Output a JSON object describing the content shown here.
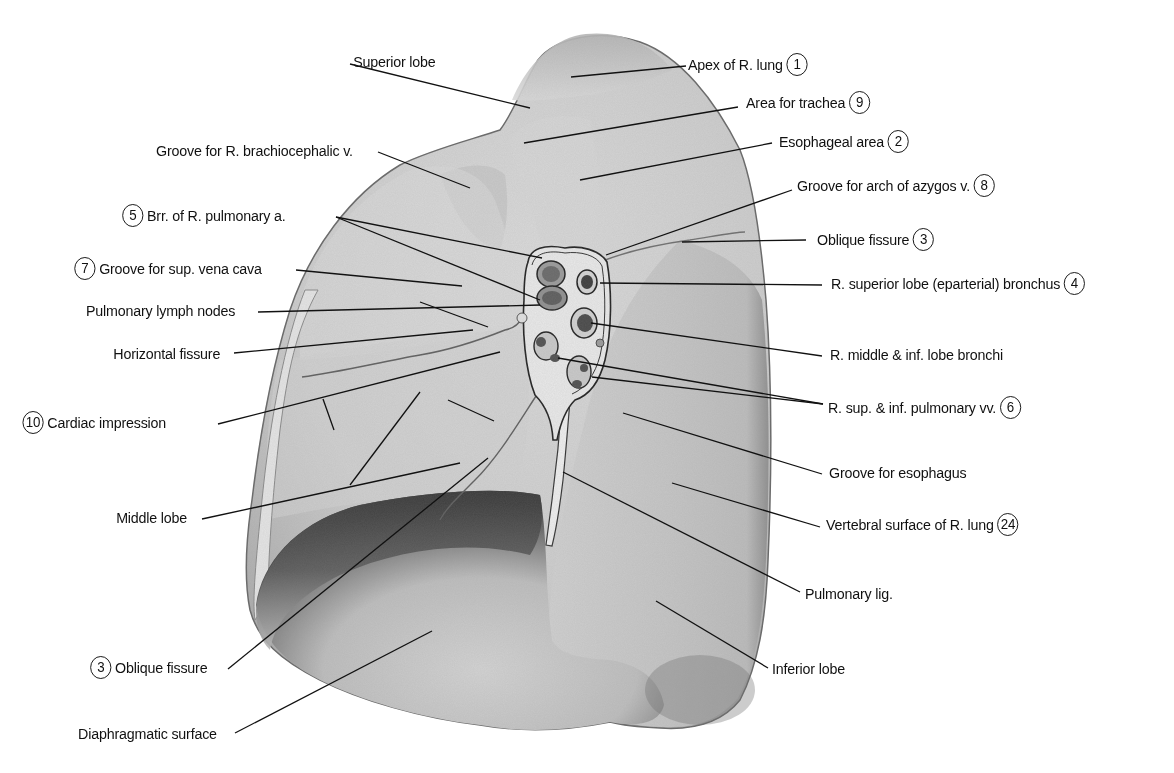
{
  "figure": {
    "colors": {
      "background": "#ffffff",
      "lung_base": "#c9c9c9",
      "lung_light": "#dcdcdc",
      "shadow": "#5a5a5a",
      "leader": "#111111"
    }
  },
  "labels": {
    "left": [
      {
        "id": "superior-lobe",
        "text": "Superior lobe",
        "num": null,
        "x": 346,
        "y": 52,
        "ax": 530,
        "ay": 108,
        "lx": 350,
        "ly": 64
      },
      {
        "id": "groove-brachiocephalic",
        "text": "Groove for R. brachiocephalic v.",
        "num": null,
        "x": 139,
        "y": 141,
        "ax": 470,
        "ay": 188,
        "lx": 378,
        "ly": 152
      },
      {
        "id": "brr-pulmonary-a",
        "text": "Brr. of R. pulmonary a.",
        "num": "5",
        "x": 108,
        "y": 206,
        "ax": 542,
        "ay": 258,
        "ax2": 540,
        "ay2": 300,
        "lx": 336,
        "ly": 217
      },
      {
        "id": "groove-svc",
        "text": "Groove for sup. vena cava",
        "num": "7",
        "x": 58,
        "y": 259,
        "ax": 462,
        "ay": 286,
        "lx": 296,
        "ly": 270
      },
      {
        "id": "pulmonary-lymph-nodes",
        "text": "Pulmonary lymph nodes",
        "num": null,
        "x": 73,
        "y": 301,
        "ax": 540,
        "ay": 305,
        "lx": 258,
        "ly": 312
      },
      {
        "id": "horizontal-fissure",
        "text": "Horizontal fissure",
        "num": null,
        "x": 104,
        "y": 344,
        "ax": 473,
        "ay": 330,
        "lx": 234,
        "ly": 353
      },
      {
        "id": "cardiac-impression",
        "text": "Cardiac impression",
        "num": "10",
        "x": 10,
        "y": 413,
        "ax": 500,
        "ay": 352,
        "lx": 218,
        "ly": 424
      },
      {
        "id": "middle-lobe",
        "text": "Middle lobe",
        "num": null,
        "x": 110,
        "y": 508,
        "ax": 460,
        "ay": 463,
        "lx": 202,
        "ly": 519
      },
      {
        "id": "oblique-fissure-left",
        "text": "Oblique fissure",
        "num": "3",
        "x": 80,
        "y": 658,
        "ax": 488,
        "ay": 458,
        "lx": 228,
        "ly": 669
      },
      {
        "id": "diaphragmatic-surface",
        "text": "Diaphragmatic surface",
        "num": null,
        "x": 66,
        "y": 724,
        "ax": 432,
        "ay": 631,
        "lx": 235,
        "ly": 733
      }
    ],
    "right": [
      {
        "id": "apex",
        "text": "Apex of R. lung",
        "num": "1",
        "numPos": "after",
        "x": 688,
        "y": 55,
        "ax": 571,
        "ay": 77,
        "lx": 686,
        "ly": 66
      },
      {
        "id": "area-trachea",
        "text": "Area for trachea",
        "num": "9",
        "numPos": "after",
        "x": 746,
        "y": 93,
        "ax": 524,
        "ay": 143,
        "lx": 738,
        "ly": 107
      },
      {
        "id": "esophageal-area",
        "text": "Esophageal area",
        "num": "2",
        "numPos": "after",
        "x": 779,
        "y": 132,
        "ax": 580,
        "ay": 180,
        "lx": 772,
        "ly": 143
      },
      {
        "id": "groove-azygos",
        "text": "Groove for arch of azygos v.",
        "num": "8",
        "numPos": "after",
        "x": 797,
        "y": 176,
        "ax": 606,
        "ay": 255,
        "lx": 792,
        "ly": 190
      },
      {
        "id": "oblique-fissure-right",
        "text": "Oblique fissure",
        "num": "3",
        "numPos": "after",
        "x": 817,
        "y": 230,
        "ax": 682,
        "ay": 242,
        "lx": 806,
        "ly": 240
      },
      {
        "id": "r-superior-bronchus",
        "text": "R. superior lobe (eparterial) bronchus",
        "num": "4",
        "numPos": "after",
        "x": 831,
        "y": 274,
        "ax": 600,
        "ay": 283,
        "lx": 822,
        "ly": 285
      },
      {
        "id": "r-middle-inf-bronchi",
        "text": "R. middle & inf. lobe bronchi",
        "num": null,
        "x": 830,
        "y": 345,
        "ax": 591,
        "ay": 323,
        "lx": 822,
        "ly": 356
      },
      {
        "id": "r-pulmonary-vv",
        "text": "R. sup. & inf. pulmonary vv.",
        "num": "6",
        "numPos": "after",
        "x": 828,
        "y": 398,
        "ax": 558,
        "ay": 358,
        "ax2": 592,
        "ay2": 377,
        "lx": 823,
        "ly": 404
      },
      {
        "id": "groove-esophagus",
        "text": "Groove for esophagus",
        "num": null,
        "x": 829,
        "y": 463,
        "ax": 623,
        "ay": 413,
        "lx": 822,
        "ly": 474
      },
      {
        "id": "vertebral-surface",
        "text": "Vertebral surface of R. lung",
        "num": "24",
        "numPos": "after",
        "x": 826,
        "y": 515,
        "ax": 672,
        "ay": 483,
        "lx": 820,
        "ly": 527
      },
      {
        "id": "pulmonary-lig",
        "text": "Pulmonary lig.",
        "num": null,
        "x": 805,
        "y": 584,
        "ax": 563,
        "ay": 472,
        "lx": 800,
        "ly": 592
      },
      {
        "id": "inferior-lobe",
        "text": "Inferior lobe",
        "num": null,
        "x": 772,
        "y": 659,
        "ax": 656,
        "ay": 601,
        "lx": 768,
        "ly": 668
      }
    ]
  },
  "extra_leaders": [
    {
      "x1": 420,
      "y1": 302,
      "x2": 488,
      "y2": 327
    },
    {
      "x1": 323,
      "y1": 399,
      "x2": 334,
      "y2": 430
    },
    {
      "x1": 448,
      "y1": 400,
      "x2": 494,
      "y2": 421
    },
    {
      "x1": 350,
      "y1": 485,
      "x2": 420,
      "y2": 392
    }
  ]
}
